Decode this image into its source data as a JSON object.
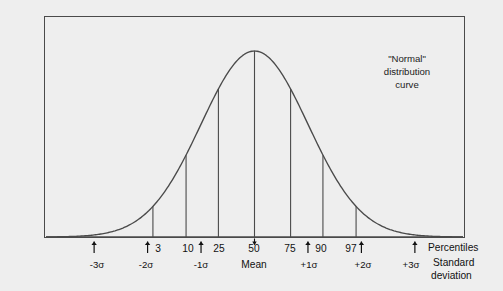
{
  "figure": {
    "annotation_title": "\"Normal\"",
    "annotation_line2": "distribution",
    "annotation_line3": "curve",
    "caption_percentiles": "Percentiles",
    "caption_sd_line1": "Standard",
    "caption_sd_line2": "deviation",
    "mean_label": "Mean",
    "frame_color": "#4a4a4a",
    "curve_color": "#4a4a4a",
    "background_color": "#eeeeee",
    "text_color": "#111111"
  },
  "chart_data": {
    "type": "line",
    "title": "\"Normal\" distribution curve",
    "xlabel": "Standard deviation",
    "ylabel": "",
    "grid": false,
    "legend": "none",
    "xlim": [
      -3.9,
      3.9
    ],
    "ylim": [
      0,
      1
    ],
    "curve": {
      "name": "normal-distribution",
      "x": [
        -3.9,
        -3.6,
        -3.3,
        -3.0,
        -2.7,
        -2.4,
        -2.1,
        -1.8,
        -1.5,
        -1.2,
        -0.9,
        -0.6,
        -0.3,
        0.0,
        0.3,
        0.6,
        0.9,
        1.2,
        1.5,
        1.8,
        2.1,
        2.4,
        2.7,
        3.0,
        3.3,
        3.6,
        3.9
      ],
      "y": [
        0.0005,
        0.0015,
        0.0042,
        0.0111,
        0.0266,
        0.0561,
        0.1103,
        0.1979,
        0.3247,
        0.4868,
        0.667,
        0.8353,
        0.956,
        1.0,
        0.956,
        0.8353,
        0.667,
        0.4868,
        0.3247,
        0.1979,
        0.1103,
        0.0561,
        0.0266,
        0.0111,
        0.0042,
        0.0015,
        0.0005
      ]
    },
    "drop_lines": [
      {
        "percentile": "3",
        "sigma": -1.9,
        "height": 0.164
      },
      {
        "percentile": "10",
        "sigma": -1.28,
        "height": 0.4398
      },
      {
        "percentile": "25",
        "sigma": -0.675,
        "height": 0.7962
      },
      {
        "percentile": "50",
        "sigma": 0.0,
        "height": 1.0
      },
      {
        "percentile": "75",
        "sigma": 0.675,
        "height": 0.7962
      },
      {
        "percentile": "90",
        "sigma": 1.28,
        "height": 0.4398
      },
      {
        "percentile": "97",
        "sigma": 1.9,
        "height": 0.164
      }
    ],
    "percentile_ticks": [
      {
        "label": "3",
        "sigma": -1.9
      },
      {
        "label": "10",
        "sigma": -1.28
      },
      {
        "label": "25",
        "sigma": -0.675
      },
      {
        "label": "50",
        "sigma": 0.0
      },
      {
        "label": "75",
        "sigma": 0.675
      },
      {
        "label": "90",
        "sigma": 1.28
      },
      {
        "label": "97",
        "sigma": 1.9
      }
    ],
    "sigma_ticks": [
      {
        "label": "-3σ",
        "sigma": -3.0
      },
      {
        "label": "-2σ",
        "sigma": -2.0
      },
      {
        "label": "-1σ",
        "sigma": -1.0
      },
      {
        "label": "+1σ",
        "sigma": 1.0
      },
      {
        "label": "+2σ",
        "sigma": 2.0
      },
      {
        "label": "+3σ",
        "sigma": 3.0
      }
    ]
  },
  "labels": {
    "p3": "3",
    "p10": "10",
    "p25": "25",
    "p50": "50",
    "p75": "75",
    "p90": "90",
    "p97": "97",
    "sig_m3": "-3σ",
    "sig_m2": "-2σ",
    "sig_m1": "-1σ",
    "sig_p1": "+1σ",
    "sig_p2": "+2σ",
    "sig_p3": "+3σ"
  }
}
